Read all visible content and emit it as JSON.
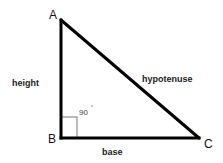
{
  "diagram": {
    "vertices": {
      "A": {
        "label": "A"
      },
      "B": {
        "label": "B"
      },
      "C": {
        "label": "C"
      }
    },
    "sides": {
      "height": "height",
      "base": "base",
      "hypotenuse": "hypotenuse"
    },
    "angle": {
      "value": "90",
      "unit": "°"
    },
    "colors": {
      "stroke": "#000000",
      "right_angle_box": "#555555",
      "text": "#222222"
    }
  }
}
